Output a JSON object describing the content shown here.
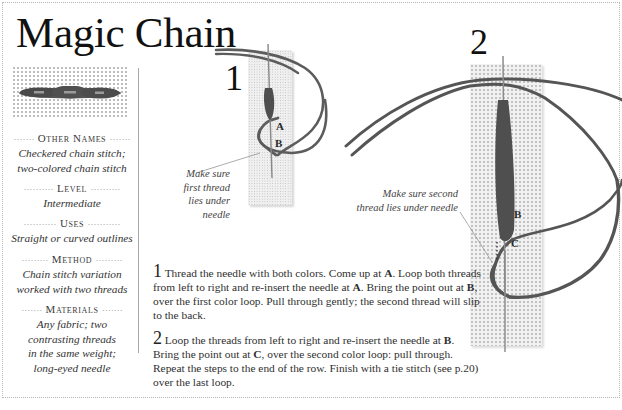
{
  "page": {
    "title": "Magic Chain",
    "colors": {
      "thread": "#5a5a5a",
      "canvas": "#f0f0f0",
      "text": "#2a2a2a",
      "border_dots": "#b9b9b9"
    }
  },
  "sidebar": {
    "sample_image": "finished-magic-chain-stitch-sample",
    "sections": [
      {
        "heading": "Other Names",
        "body": [
          "Checkered chain stitch;",
          "two-colored chain stitch"
        ]
      },
      {
        "heading": "Level",
        "body": [
          "Intermediate"
        ]
      },
      {
        "heading": "Uses",
        "body": [
          "Straight or curved outlines"
        ]
      },
      {
        "heading": "Method",
        "body": [
          "Chain stitch variation",
          "worked with two threads"
        ]
      },
      {
        "heading": "Materials",
        "body": [
          "Any fabric; two",
          "contrasting threads",
          "in the same weight;",
          "long-eyed needle"
        ]
      }
    ]
  },
  "illustrations": [
    {
      "step": "1",
      "labels": [
        "A",
        "B"
      ],
      "callout": [
        "Make sure",
        "first thread",
        "lies under",
        "needle"
      ]
    },
    {
      "step": "2",
      "labels": [
        "B",
        "C"
      ],
      "callout": [
        "Make sure second",
        "thread lies under needle"
      ]
    }
  ],
  "instructions": [
    {
      "num": "1",
      "parts": [
        "Thread the needle with both colors. Come up at ",
        "A",
        ". Loop both threads from left to right and re-insert the needle at ",
        "A",
        ". Bring the point out at ",
        "B",
        ", over the first color loop. Pull through gently; the second thread will slip to the back."
      ]
    },
    {
      "num": "2",
      "parts": [
        "Loop the threads from left to right and re-insert the needle at ",
        "B",
        ". Bring the point out at ",
        "C",
        ", over the second color loop: pull through. Repeat the steps to the end of the row. Finish with a tie stitch (see p.20) over the last loop."
      ]
    }
  ]
}
